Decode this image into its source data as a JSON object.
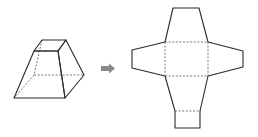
{
  "diagram": {
    "type": "geometry-net",
    "solid": {
      "name": "square-frustum",
      "hidden_edges": "dashed"
    },
    "transition": {
      "icon": "right-arrow-icon",
      "color": "#8a8a8a"
    },
    "net": {
      "faces": [
        "top-trapezoid",
        "left-trapezoid",
        "center-square",
        "right-trapezoid",
        "bottom-trapezoid",
        "small-square"
      ],
      "fold_lines": "dashed"
    },
    "colors": {
      "line": "#2a2a2a",
      "dashed": "#555555",
      "background": "#ffffff"
    }
  }
}
